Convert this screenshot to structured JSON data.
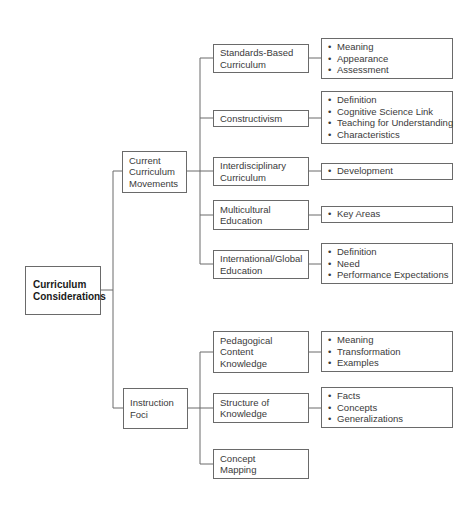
{
  "diagram": {
    "root": {
      "label": "Curriculum Considerations"
    },
    "branches": [
      {
        "label": "Current Curriculum Movements",
        "children": [
          {
            "label": "Standards-Based Curriculum",
            "items": [
              "Meaning",
              "Appearance",
              "Assessment"
            ]
          },
          {
            "label": "Constructivism",
            "items": [
              "Definition",
              "Cognitive Science Link",
              "Teaching for Understanding",
              "Characteristics"
            ]
          },
          {
            "label": "Interdisciplinary Curriculum",
            "items": [
              "Development"
            ]
          },
          {
            "label": "Multicultural Education",
            "items": [
              "Key Areas"
            ]
          },
          {
            "label": "International/Global Education",
            "items": [
              "Definition",
              "Need",
              "Performance Expectations"
            ]
          }
        ]
      },
      {
        "label": "Instruction Foci",
        "children": [
          {
            "label": "Pedagogical Content Knowledge",
            "items": [
              "Meaning",
              "Transformation",
              "Examples"
            ]
          },
          {
            "label": "Structure of Knowledge",
            "items": [
              "Facts",
              "Concepts",
              "Generalizations"
            ]
          },
          {
            "label": "Concept Mapping",
            "items": []
          }
        ]
      }
    ]
  },
  "colors": {
    "line": "#6a6a6a",
    "text": "#3a3a3a",
    "root_text": "#1a1a1a"
  }
}
